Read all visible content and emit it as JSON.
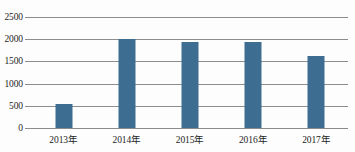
{
  "chart_data": {
    "type": "bar",
    "title": "",
    "xlabel": "",
    "ylabel": "",
    "categories": [
      "2013年",
      "2014年",
      "2015年",
      "2016年",
      "2017年"
    ],
    "values": [
      530,
      2000,
      1930,
      1945,
      1630
    ],
    "ylim": [
      0,
      2500
    ],
    "ytick_labels": [
      "0",
      "500",
      "1000",
      "1500",
      "2000",
      "2500"
    ],
    "ytick_values": [
      0,
      500,
      1000,
      1500,
      2000,
      2500
    ],
    "grid": true,
    "legend": "none",
    "series": [
      {
        "name": "",
        "values": [
          530,
          2000,
          1930,
          1945,
          1630
        ],
        "color": "#3d6e91"
      }
    ],
    "colors": {
      "bar": "#3d6e91",
      "gridline": "#8d8d8d",
      "axis_text": "#1d1d1d",
      "background": "#fdfdfd"
    }
  }
}
